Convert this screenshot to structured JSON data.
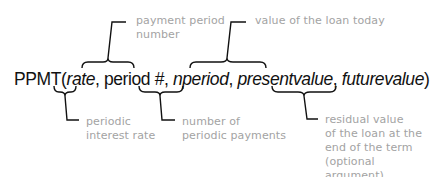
{
  "formula": {
    "function_name": "PPMT(",
    "args": [
      "rate",
      ", period #, ",
      "nperiod",
      ", ",
      "presentvalue",
      ", ",
      "futurevalue",
      ")"
    ]
  },
  "annotations": {
    "payment_period": {
      "line1": "payment period",
      "line2": "number"
    },
    "present_value": {
      "line1": "value of the loan today"
    },
    "rate": {
      "line1": "periodic",
      "line2": "interest rate"
    },
    "nperiod": {
      "line1": "number of",
      "line2": "periodic payments"
    },
    "future_value": {
      "line1": "residual value",
      "line2": "of the loan at the",
      "line3": "end of the term",
      "line4": "(optional argument)"
    }
  },
  "colors": {
    "line": "#111111",
    "annotation_text": "#a3a3a3"
  }
}
